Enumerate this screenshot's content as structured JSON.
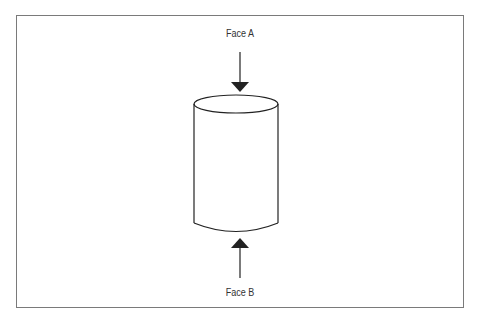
{
  "diagram": {
    "labels": {
      "face_a": "Face A",
      "face_b": "Face B"
    },
    "shape": "cylinder",
    "arrows": [
      {
        "name": "arrow-to-face-a",
        "direction": "down"
      },
      {
        "name": "arrow-to-face-b",
        "direction": "up"
      }
    ],
    "colors": {
      "stroke": "#222222",
      "frame": "#7a7a7a",
      "background": "#ffffff"
    }
  }
}
